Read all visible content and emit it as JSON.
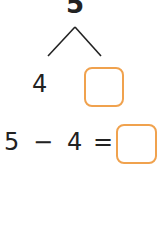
{
  "bond": {
    "whole": "5",
    "part_known": "4",
    "part_unknown": ""
  },
  "equation": {
    "a": "5",
    "op": "−",
    "b": "4",
    "eq": "=",
    "answer": ""
  },
  "colors": {
    "box_border": "#f0a24e",
    "text": "#222222"
  }
}
